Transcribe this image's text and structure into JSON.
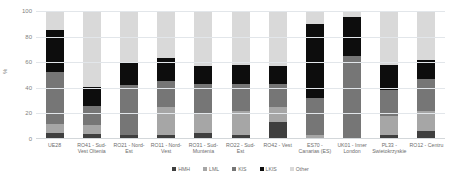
{
  "chart_data": {
    "type": "bar",
    "subtype": "stacked-percentage-column",
    "title": "",
    "xlabel": "",
    "ylabel": "%",
    "ylim": [
      0,
      100
    ],
    "yticks": [
      "0",
      "20",
      "40",
      "60",
      "80",
      "100"
    ],
    "grid": true,
    "legend_position": "bottom",
    "categories": [
      "UE28",
      "RO41 - Sud-Vest Oltenia",
      "RO21 - Nord-Est",
      "RO11 - Nord-Vest",
      "RO31 - Sud-Muntenia",
      "RO22 - Sud-Est",
      "RO42 - Vest",
      "ES70 - Canarias (ES)",
      "UK01 - Inner London",
      "PL33 - Swietokrzyskie",
      "RO12 - Centru"
    ],
    "series": [
      {
        "name": "HMH",
        "color": "#3f3f3f",
        "values": [
          5,
          4,
          3,
          3,
          5,
          3,
          13,
          0,
          0,
          3,
          6
        ]
      },
      {
        "name": "LML",
        "color": "#a6a6a6",
        "values": [
          7,
          7,
          0,
          22,
          15,
          19,
          12,
          3,
          0,
          15,
          16
        ]
      },
      {
        "name": "KIS",
        "color": "#767676",
        "values": [
          40,
          15,
          39,
          20,
          23,
          21,
          18,
          29,
          65,
          20,
          25
        ]
      },
      {
        "name": "LKIS",
        "color": "#0d0d0d",
        "values": [
          33,
          15,
          18,
          18,
          14,
          15,
          14,
          58,
          30,
          20,
          15
        ]
      },
      {
        "name": "Other",
        "color": "#d9d9d9",
        "values": [
          15,
          59,
          40,
          37,
          43,
          42,
          43,
          10,
          5,
          42,
          38
        ]
      }
    ]
  }
}
